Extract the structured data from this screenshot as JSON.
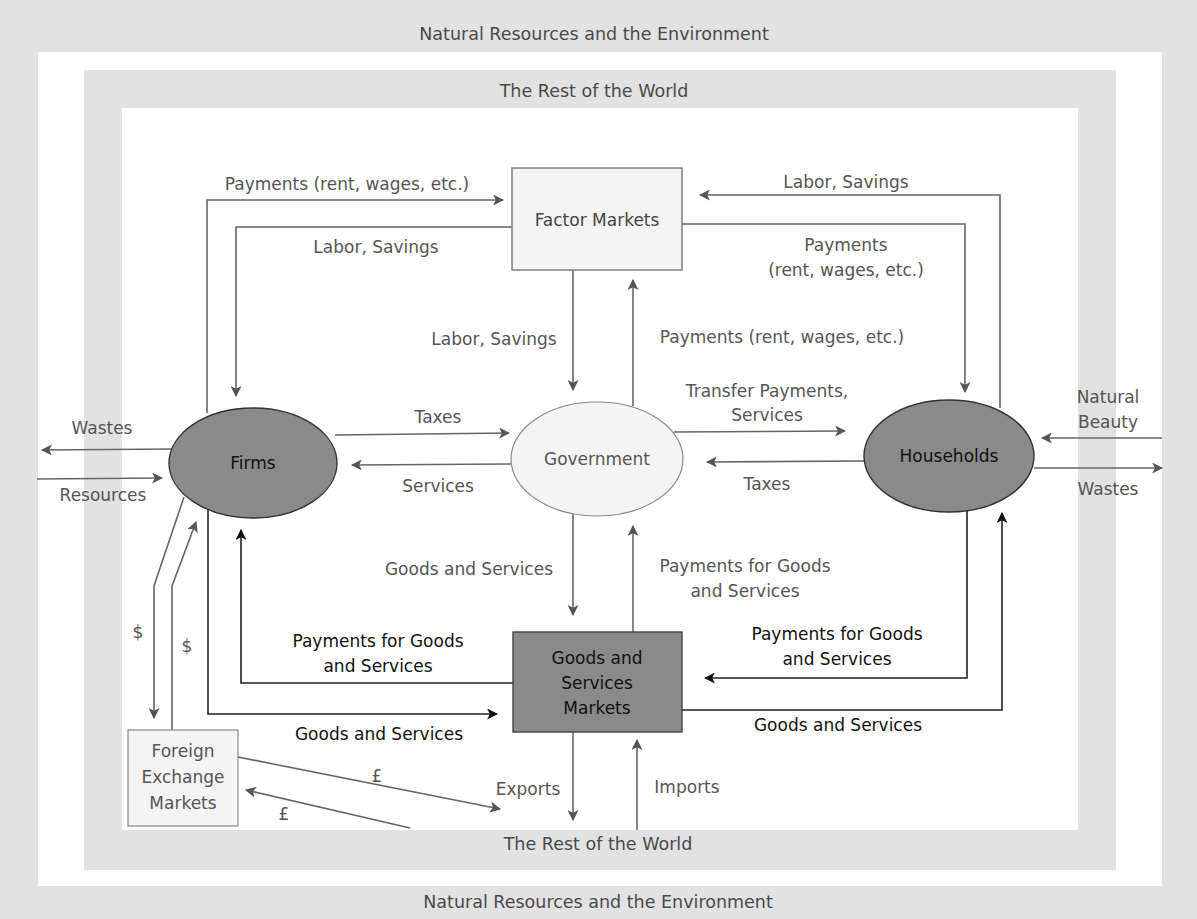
{
  "bands": {
    "outer_top": "Natural Resources and the Environment",
    "outer_bottom": "Natural Resources and the Environment",
    "row_top": "The Rest of the World",
    "row_bottom": "The Rest of the World"
  },
  "nodes": {
    "factor_markets": "Factor Markets",
    "firms": "Firms",
    "government": "Government",
    "households": "Households",
    "goods_markets": [
      "Goods and",
      "Services",
      "Markets"
    ],
    "fx_markets": [
      "Foreign",
      "Exchange",
      "Markets"
    ]
  },
  "flows": {
    "firms_to_factor": "Payments (rent, wages, etc.)",
    "factor_to_firms": "Labor, Savings",
    "households_to_factor": "Labor, Savings",
    "factor_to_households": [
      "Payments",
      "(rent, wages, etc.)"
    ],
    "factor_to_gov": "Labor, Savings",
    "gov_to_factor": "Payments (rent, wages, etc.)",
    "firms_to_gov": "Taxes",
    "gov_to_firms": "Services",
    "gov_to_households": [
      "Transfer Payments,",
      "Services"
    ],
    "households_to_gov": "Taxes",
    "firms_wastes": "Wastes",
    "firms_resources": "Resources",
    "households_natural_beauty": [
      "Natural",
      "Beauty"
    ],
    "households_wastes": "Wastes",
    "gov_to_goods": "Goods and Services",
    "goods_to_gov": [
      "Payments for Goods",
      "and Services"
    ],
    "goods_to_firms": [
      "Payments for Goods",
      "and Services"
    ],
    "firms_to_goods": "Goods and Services",
    "households_to_goods": [
      "Payments for Goods",
      "and Services"
    ],
    "goods_to_households": "Goods and Services",
    "firms_to_fx": "$",
    "fx_to_firms": "$",
    "fx_to_row": "£",
    "row_to_fx": "£",
    "exports": "Exports",
    "imports": "Imports"
  },
  "colors": {
    "band": "#e2e2e2",
    "dark_node": "#8a8a8a",
    "light_node": "#f4f4f4",
    "line": "#666666",
    "line_dark": "#222222",
    "text": "#555555"
  }
}
